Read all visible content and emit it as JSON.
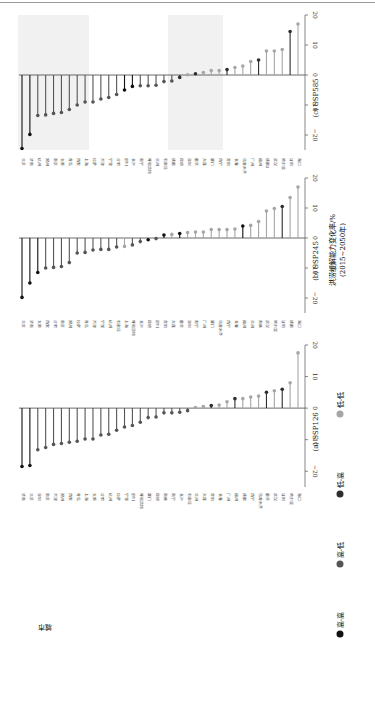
{
  "figure": {
    "ylabel_line1": "洪涝缓解能力变化率/%",
    "ylabel_line2": "(2015~2050年)",
    "city_axis_label": "城市",
    "ticks": [
      20,
      10,
      0,
      -10,
      -20
    ],
    "legend": [
      {
        "label": "高-高",
        "color": "#111111"
      },
      {
        "label": "高-低",
        "color": "#555555"
      },
      {
        "label": "低-高",
        "color": "#2e2e2e"
      },
      {
        "label": "低-低",
        "color": "#a6a6a6"
      }
    ]
  },
  "chart_data": [
    {
      "type": "lollipop",
      "title": "(c) SSP585",
      "ylim": [
        -25,
        20
      ],
      "shaded_ranges": [
        [
          0,
          8
        ],
        [
          19,
          25
        ]
      ],
      "categories": [
        "北京",
        "济南",
        "杭州",
        "郑州",
        "南京",
        "太原",
        "青岛",
        "西安",
        "上海",
        "拉萨",
        "天津",
        "宁波",
        "合肥",
        "银川",
        "长沙",
        "南宁",
        "呼和浩特",
        "兰州",
        "石家庄",
        "成都",
        "昆明",
        "深圳",
        "重庆",
        "大连",
        "厦门",
        "西宁",
        "贵阳",
        "长春",
        "乌鲁木齐",
        "广州",
        "福州",
        "成都2",
        "武汉",
        "哈尔滨",
        "沈阳",
        "海口"
      ],
      "values": [
        -24.5,
        -19.8,
        -13.5,
        -13.3,
        -12.8,
        -12.5,
        -11.5,
        -10,
        -9,
        -9,
        -8,
        -7.5,
        -6.5,
        -5,
        -3.8,
        -3.6,
        -3.6,
        -3.4,
        -2.2,
        -2,
        -0.8,
        0.1,
        0.4,
        0.8,
        1.5,
        1.5,
        1.8,
        2.5,
        3,
        4.5,
        5,
        8,
        8,
        8.5,
        14.5,
        17
      ],
      "groups": [
        0,
        0,
        1,
        1,
        1,
        1,
        1,
        1,
        1,
        1,
        1,
        1,
        1,
        0,
        0,
        1,
        1,
        1,
        1,
        1,
        2,
        3,
        2,
        3,
        3,
        3,
        2,
        3,
        3,
        3,
        2,
        3,
        3,
        3,
        2,
        3
      ]
    },
    {
      "type": "lollipop",
      "title": "(b) SSP245",
      "ylim": [
        -25,
        20
      ],
      "shaded_ranges": [],
      "categories": [
        "北京",
        "济南",
        "太原",
        "西安",
        "合肥",
        "南京",
        "郑州",
        "拉萨",
        "青岛",
        "天津",
        "宁波",
        "杭州",
        "石家庄",
        "上海",
        "呼和浩特",
        "长沙",
        "昆明",
        "银川",
        "贵阳",
        "大连",
        "重庆",
        "深圳",
        "南宁",
        "广州",
        "厦门",
        "乌鲁木齐",
        "西宁",
        "长春",
        "福州",
        "兰州",
        "南昌",
        "武汉",
        "哈尔滨",
        "沈阳",
        "成都",
        "海口"
      ],
      "values": [
        -19.8,
        -15,
        -11.5,
        -10,
        -9.8,
        -9.5,
        -8.2,
        -5,
        -4.8,
        -4,
        -3.8,
        -3.8,
        -3,
        -2.8,
        -2.3,
        -1.2,
        -0.6,
        -0.2,
        1,
        1.2,
        1.5,
        1.8,
        2,
        2,
        2.8,
        2.8,
        2.8,
        3,
        4,
        4.2,
        5.5,
        9,
        9.8,
        10.5,
        13.5,
        17
      ],
      "groups": [
        0,
        0,
        0,
        1,
        1,
        1,
        1,
        1,
        1,
        1,
        1,
        1,
        1,
        3,
        1,
        1,
        0,
        1,
        0,
        3,
        0,
        3,
        3,
        3,
        3,
        3,
        3,
        3,
        0,
        3,
        3,
        3,
        3,
        2,
        3,
        3
      ]
    },
    {
      "type": "lollipop",
      "title": "(a) SSP126",
      "ylim": [
        -25,
        20
      ],
      "shaded_ranges": [],
      "categories": [
        "济南",
        "北京",
        "深圳",
        "南京",
        "天津",
        "郑州",
        "西安",
        "青岛",
        "上海",
        "太原",
        "合肥",
        "杭州",
        "拉萨",
        "宁波",
        "银川",
        "呼和浩特",
        "厦门",
        "昆明",
        "南昌",
        "南宁",
        "长沙",
        "石家庄",
        "兰州",
        "大连",
        "贵阳",
        "长春",
        "广州",
        "福州",
        "成都",
        "西宁",
        "乌鲁木齐",
        "重庆",
        "武汉",
        "沈阳",
        "哈尔滨",
        "海口"
      ],
      "values": [
        -18.5,
        -18.2,
        -13.2,
        -12.5,
        -11.5,
        -11.2,
        -10.8,
        -10.5,
        -9.8,
        -9.8,
        -8.5,
        -8.3,
        -7,
        -6,
        -5.5,
        -4.5,
        -3,
        -2.8,
        -1.5,
        -1.5,
        -1.3,
        -0.8,
        0.2,
        0.5,
        0.8,
        1,
        2,
        3,
        3,
        3.5,
        3.8,
        5,
        5.5,
        6,
        8,
        17.5
      ],
      "groups": [
        0,
        0,
        1,
        1,
        1,
        1,
        1,
        1,
        1,
        1,
        1,
        1,
        1,
        1,
        1,
        1,
        1,
        1,
        1,
        1,
        1,
        1,
        3,
        3,
        2,
        3,
        3,
        2,
        3,
        3,
        3,
        2,
        3,
        2,
        3,
        3
      ]
    }
  ]
}
